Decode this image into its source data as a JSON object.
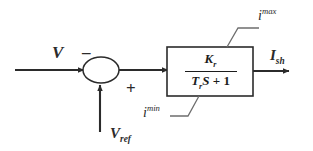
{
  "figure": {
    "kind": "control-block-diagram",
    "background_color": "#ffffff",
    "line_color": "#2b2b2b",
    "text_color": "#1c1c1c"
  },
  "signals": {
    "input_measured": "V",
    "input_reference_base": "V",
    "input_reference_sub": "ref",
    "output_base": "I",
    "output_sub": "sh"
  },
  "summing_junction": {
    "shape": "ellipse",
    "sign_measured": "–",
    "sign_reference": "+"
  },
  "block": {
    "numerator": "K",
    "numerator_sub": "r",
    "denominator_var": "T",
    "denominator_var_sub": "r",
    "denominator_s": "S",
    "denominator_op": "+",
    "denominator_const": "1"
  },
  "limits": {
    "upper_base": "i",
    "upper_sup": "max",
    "lower_base": "i",
    "lower_sup": "min"
  }
}
